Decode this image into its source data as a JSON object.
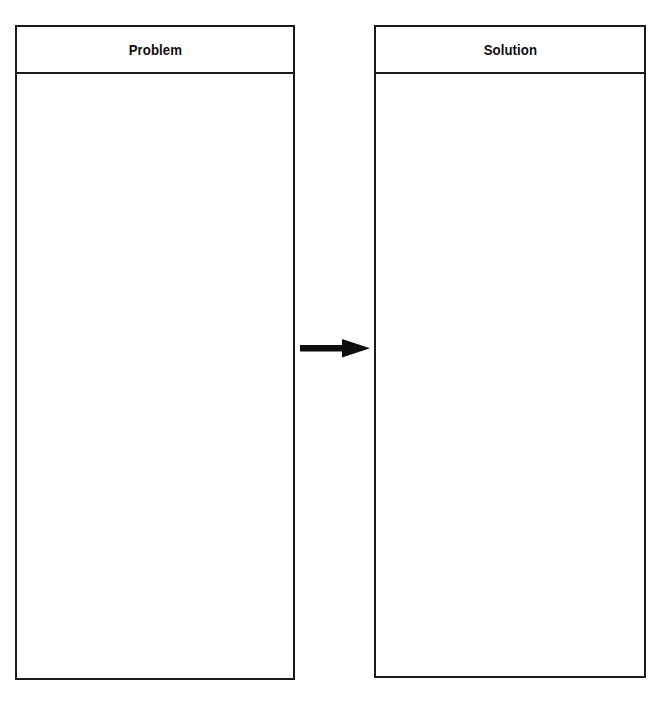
{
  "diagram": {
    "type": "problem-solution-flow",
    "background_color": "#ffffff",
    "line_color": "#1a1a1a",
    "panels": [
      {
        "id": "problem",
        "title": "Problem",
        "body_text": ""
      },
      {
        "id": "solution",
        "title": "Solution",
        "body_text": ""
      }
    ],
    "connector": {
      "name": "right-arrow",
      "direction": "left-to-right",
      "color": "#0d0d0d",
      "from": "problem",
      "to": "solution"
    }
  }
}
